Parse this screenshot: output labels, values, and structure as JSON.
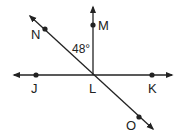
{
  "diagram": {
    "type": "geometry-lines",
    "points": [
      {
        "id": "M",
        "label": "M"
      },
      {
        "id": "N",
        "label": "N"
      },
      {
        "id": "J",
        "label": "J"
      },
      {
        "id": "L",
        "label": "L"
      },
      {
        "id": "K",
        "label": "K"
      },
      {
        "id": "O",
        "label": "O"
      }
    ],
    "angle_label": "48°",
    "lines": [
      "ray LM",
      "line JK",
      "line NO"
    ],
    "stroke_color": "#222222"
  }
}
